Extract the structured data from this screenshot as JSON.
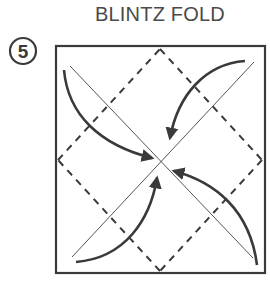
{
  "title": "BLINTZ FOLD",
  "step": {
    "number": "5"
  },
  "diagram": {
    "colors": {
      "line": "#3a3a3a",
      "text": "#4a4a4a",
      "background": "#ffffff"
    },
    "arrows": [
      "top-left-corner-to-center",
      "top-right-corner-to-center",
      "bottom-right-corner-to-center",
      "bottom-left-corner-to-center"
    ]
  }
}
